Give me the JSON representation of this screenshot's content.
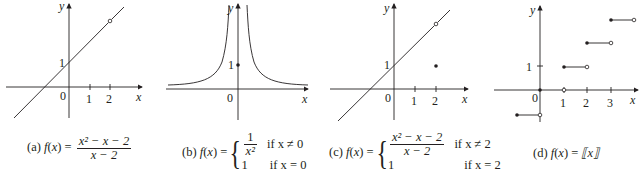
{
  "figure": {
    "panels": [
      {
        "id": "a",
        "caption_prefix": "(a)",
        "func_name": "f",
        "func_var": "x",
        "equals": "=",
        "numerator": "x² − x − 2",
        "denominator": "x − 2",
        "axis_labels": {
          "x": "x",
          "y": "y"
        },
        "tick_labels": {
          "origin": "0",
          "x1": "1",
          "x2": "2",
          "y1": "1"
        },
        "features": {
          "line": "y = x + 1",
          "open_point": [
            2,
            3
          ]
        }
      },
      {
        "id": "b",
        "caption_prefix": "(b)",
        "func_name": "f",
        "func_var": "x",
        "equals": "=",
        "case1_num": "1",
        "case1_den": "x²",
        "case1_cond": "if x ≠ 0",
        "case2_val": "1",
        "case2_cond": "if x = 0",
        "axis_labels": {
          "x": "x",
          "y": "y"
        },
        "tick_labels": {
          "origin": "0",
          "y1": "1"
        },
        "features": {
          "curve": "y = 1/x²",
          "filled_point": [
            0,
            1
          ]
        }
      },
      {
        "id": "c",
        "caption_prefix": "(c)",
        "func_name": "f",
        "func_var": "x",
        "equals": "=",
        "case1_num": "x² − x − 2",
        "case1_den": "x − 2",
        "case1_cond": "if x ≠ 2",
        "case2_val": "1",
        "case2_cond": "if x = 2",
        "axis_labels": {
          "x": "x",
          "y": "y"
        },
        "tick_labels": {
          "origin": "0",
          "x1": "1",
          "x2": "2",
          "y1": "1"
        },
        "features": {
          "line": "y = x + 1",
          "open_point": [
            2,
            3
          ],
          "filled_point": [
            2,
            1
          ]
        }
      },
      {
        "id": "d",
        "caption_prefix": "(d)",
        "func_name": "f",
        "func_var": "x",
        "equals": "=",
        "bracket_expr": "⟦x⟧",
        "axis_labels": {
          "x": "x",
          "y": "y"
        },
        "tick_labels": {
          "origin": "0",
          "x1": "1",
          "x2": "2",
          "x3": "3",
          "y1": "1"
        },
        "features": {
          "steps": [
            {
              "from": -1,
              "to": 0,
              "y": -1
            },
            {
              "from": 0,
              "to": 1,
              "y": 0
            },
            {
              "from": 1,
              "to": 2,
              "y": 1
            },
            {
              "from": 2,
              "to": 3,
              "y": 2
            },
            {
              "from": 3,
              "to": 4,
              "y": 3
            }
          ]
        }
      }
    ],
    "colors": {
      "ink": "#231f20",
      "background": "#ffffff"
    }
  }
}
